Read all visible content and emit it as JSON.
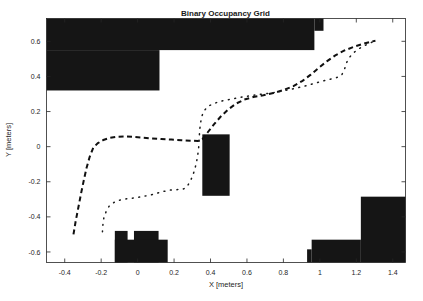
{
  "figure": {
    "title": "Binary Occupancy Grid",
    "background_color": "#ffffff",
    "occupied_color": "#151515",
    "free_color": "#ffffff",
    "axis_color": "#262626"
  },
  "chart_data": {
    "type": "heatmap",
    "title": "Binary Occupancy Grid",
    "xlabel": "X [meters]",
    "ylabel": "Y [meters]",
    "xlim": [
      -0.5,
      1.47
    ],
    "ylim": [
      -0.66,
      0.73
    ],
    "grid": false,
    "legend": "none",
    "xticks": [
      -0.4,
      -0.2,
      0,
      0.2,
      0.4,
      0.6,
      0.8,
      1,
      1.2,
      1.4
    ],
    "xticklabels": [
      "-0.4",
      "-0.2",
      "0",
      "0.2",
      "0.4",
      "0.6",
      "0.8",
      "1",
      "1.2",
      "1.4"
    ],
    "yticks": [
      0.6,
      0.4,
      0.2,
      0,
      -0.2,
      -0.4,
      -0.6
    ],
    "yticklabels": [
      "0.6",
      "0.4",
      "0.2",
      "0",
      "-0.2",
      "-0.4",
      "-0.6"
    ],
    "occupied_regions": [
      {
        "name": "top-left-wall-upper",
        "x0": -0.5,
        "x1": 0.97,
        "y0": 0.55,
        "y1": 0.73
      },
      {
        "name": "top-left-wall-lower",
        "x0": -0.5,
        "x1": 0.12,
        "y0": 0.32,
        "y1": 0.55
      },
      {
        "name": "top-right-notch",
        "x0": 0.97,
        "x1": 1.02,
        "y0": 0.66,
        "y1": 0.73
      },
      {
        "name": "center-pillar",
        "x0": 0.355,
        "x1": 0.505,
        "y0": -0.28,
        "y1": 0.07
      },
      {
        "name": "bottom-left-block-a",
        "x0": -0.125,
        "x1": -0.055,
        "y0": -0.66,
        "y1": -0.48
      },
      {
        "name": "bottom-left-block-b",
        "x0": -0.02,
        "x1": 0.115,
        "y0": -0.66,
        "y1": -0.48
      },
      {
        "name": "bottom-left-block-c",
        "x0": -0.125,
        "x1": 0.165,
        "y0": -0.66,
        "y1": -0.53
      },
      {
        "name": "bottom-right-wall-tall",
        "x0": 1.225,
        "x1": 1.47,
        "y0": -0.66,
        "y1": -0.285
      },
      {
        "name": "bottom-right-wall-low",
        "x0": 0.955,
        "x1": 1.225,
        "y0": -0.66,
        "y1": -0.53
      },
      {
        "name": "bottom-right-wall-step",
        "x0": 0.93,
        "x1": 0.955,
        "y0": -0.66,
        "y1": -0.585
      }
    ],
    "series": [
      {
        "name": "planned-path-dashed",
        "style": "dashed",
        "points": [
          [
            -0.352,
            -0.5
          ],
          [
            -0.34,
            -0.425
          ],
          [
            -0.325,
            -0.345
          ],
          [
            -0.31,
            -0.265
          ],
          [
            -0.295,
            -0.19
          ],
          [
            -0.28,
            -0.12
          ],
          [
            -0.263,
            -0.058
          ],
          [
            -0.243,
            -0.005
          ],
          [
            -0.218,
            0.02
          ],
          [
            -0.188,
            0.038
          ],
          [
            -0.152,
            0.05
          ],
          [
            -0.115,
            0.056
          ],
          [
            -0.075,
            0.058
          ],
          [
            -0.03,
            0.056
          ],
          [
            0.02,
            0.052
          ],
          [
            0.075,
            0.047
          ],
          [
            0.13,
            0.043
          ],
          [
            0.185,
            0.04
          ],
          [
            0.24,
            0.037
          ],
          [
            0.29,
            0.034
          ],
          [
            0.33,
            0.032
          ],
          [
            0.355,
            0.042
          ],
          [
            0.385,
            0.082
          ],
          [
            0.42,
            0.128
          ],
          [
            0.455,
            0.17
          ],
          [
            0.495,
            0.21
          ],
          [
            0.54,
            0.245
          ],
          [
            0.585,
            0.268
          ],
          [
            0.635,
            0.283
          ],
          [
            0.69,
            0.293
          ],
          [
            0.745,
            0.305
          ],
          [
            0.8,
            0.322
          ],
          [
            0.855,
            0.345
          ],
          [
            0.905,
            0.375
          ],
          [
            0.95,
            0.41
          ],
          [
            0.995,
            0.45
          ],
          [
            1.04,
            0.487
          ],
          [
            1.085,
            0.52
          ],
          [
            1.135,
            0.548
          ],
          [
            1.185,
            0.568
          ],
          [
            1.235,
            0.585
          ],
          [
            1.28,
            0.598
          ],
          [
            1.305,
            0.603
          ]
        ]
      },
      {
        "name": "measured-path-dotted",
        "style": "dotted",
        "points": [
          [
            -0.193,
            -0.485
          ],
          [
            -0.19,
            -0.44
          ],
          [
            -0.185,
            -0.403
          ],
          [
            -0.172,
            -0.368
          ],
          [
            -0.155,
            -0.337
          ],
          [
            -0.13,
            -0.318
          ],
          [
            -0.1,
            -0.305
          ],
          [
            -0.06,
            -0.297
          ],
          [
            -0.015,
            -0.292
          ],
          [
            0.035,
            -0.283
          ],
          [
            0.085,
            -0.272
          ],
          [
            0.13,
            -0.258
          ],
          [
            0.175,
            -0.248
          ],
          [
            0.215,
            -0.245
          ],
          [
            0.248,
            -0.243
          ],
          [
            0.268,
            -0.232
          ],
          [
            0.285,
            -0.205
          ],
          [
            0.3,
            -0.172
          ],
          [
            0.312,
            -0.135
          ],
          [
            0.322,
            -0.095
          ],
          [
            0.33,
            -0.048
          ],
          [
            0.335,
            -0.005
          ],
          [
            0.338,
            0.042
          ],
          [
            0.34,
            0.088
          ],
          [
            0.345,
            0.133
          ],
          [
            0.352,
            0.172
          ],
          [
            0.365,
            0.205
          ],
          [
            0.39,
            0.232
          ],
          [
            0.425,
            0.248
          ],
          [
            0.47,
            0.262
          ],
          [
            0.52,
            0.272
          ],
          [
            0.575,
            0.283
          ],
          [
            0.63,
            0.292
          ],
          [
            0.69,
            0.3
          ],
          [
            0.75,
            0.308
          ],
          [
            0.81,
            0.32
          ],
          [
            0.87,
            0.333
          ],
          [
            0.93,
            0.348
          ],
          [
            0.985,
            0.365
          ],
          [
            1.04,
            0.38
          ],
          [
            1.09,
            0.392
          ],
          [
            1.12,
            0.408
          ],
          [
            1.135,
            0.44
          ],
          [
            1.145,
            0.475
          ],
          [
            1.16,
            0.505
          ],
          [
            1.18,
            0.53
          ],
          [
            1.205,
            0.552
          ],
          [
            1.235,
            0.57
          ],
          [
            1.265,
            0.585
          ],
          [
            1.292,
            0.598
          ]
        ]
      }
    ]
  }
}
